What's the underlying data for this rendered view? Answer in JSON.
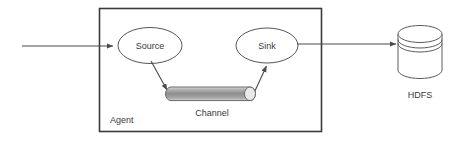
{
  "diagram": {
    "container": {
      "name": "Agent",
      "label": "Agent"
    },
    "nodes": [
      {
        "id": "source",
        "label": "Source",
        "shape": "ellipse"
      },
      {
        "id": "channel",
        "label": "Channel",
        "shape": "cylinder-horizontal"
      },
      {
        "id": "sink",
        "label": "Sink",
        "shape": "ellipse"
      },
      {
        "id": "hdfs",
        "label": "HDFS",
        "shape": "cylinder-vertical"
      }
    ],
    "edges": [
      {
        "id": "input-to-source",
        "from": "external-input",
        "to": "source",
        "arrow": "end"
      },
      {
        "id": "source-to-channel",
        "from": "source",
        "to": "channel",
        "arrow": "end"
      },
      {
        "id": "channel-to-sink",
        "from": "channel",
        "to": "sink",
        "arrow": "end"
      },
      {
        "id": "sink-to-hdfs",
        "from": "sink",
        "to": "hdfs",
        "arrow": "end"
      }
    ],
    "colors": {
      "background": "#ffffff",
      "stroke": "#555555",
      "box_stroke": "#3b3b3b",
      "text": "#3a3a3a",
      "channel_fill_light": "#e6e6e6",
      "channel_fill_mid": "#8f8f8f",
      "channel_cap": "#e9e9e9"
    }
  }
}
